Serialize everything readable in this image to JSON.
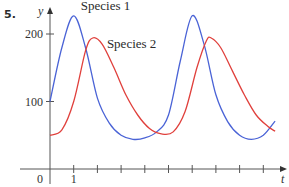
{
  "figure": {
    "problem_number": "5."
  },
  "chart_data": {
    "type": "line",
    "title": "",
    "xlabel": "t",
    "ylabel": "y",
    "xlim": [
      0,
      9.8
    ],
    "ylim": [
      0,
      240
    ],
    "x_ticks": [
      0,
      1,
      2,
      3,
      4,
      5,
      6,
      7,
      8,
      9
    ],
    "x_tick_labels": [
      {
        "value": 0,
        "label": "0"
      },
      {
        "value": 1,
        "label": "1"
      }
    ],
    "y_ticks": [
      100,
      200
    ],
    "y_tick_labels": [
      {
        "value": 100,
        "label": "100"
      },
      {
        "value": 200,
        "label": "200"
      }
    ],
    "grid": false,
    "legend": "inline labels",
    "series": [
      {
        "name": "Species 1",
        "color": "#4a63d6",
        "label_pos": {
          "t": 1.3,
          "v": 236
        },
        "x": [
          0,
          0.5,
          1,
          1.5,
          2,
          2.5,
          3,
          3.5,
          4,
          4.5,
          5,
          5.5,
          6,
          6.5,
          7,
          7.5,
          8,
          8.5,
          9,
          9.5
        ],
        "values": [
          100,
          180,
          227,
          180,
          105,
          68,
          50,
          44,
          46,
          55,
          80,
          160,
          227,
          185,
          110,
          70,
          50,
          44,
          50,
          71
        ]
      },
      {
        "name": "Species 2",
        "color": "#e0403c",
        "label_pos": {
          "t": 2.4,
          "v": 180
        },
        "x": [
          0,
          0.5,
          1,
          1.5,
          1.8,
          2.2,
          2.7,
          3.2,
          3.7,
          4.2,
          4.7,
          5.2,
          5.7,
          6.2,
          6.6,
          6.8,
          7.2,
          7.7,
          8.2,
          8.7,
          9.2,
          9.5
        ],
        "values": [
          50,
          58,
          100,
          175,
          194,
          185,
          150,
          110,
          80,
          60,
          52,
          55,
          85,
          150,
          190,
          194,
          180,
          145,
          110,
          80,
          63,
          56
        ]
      }
    ]
  }
}
